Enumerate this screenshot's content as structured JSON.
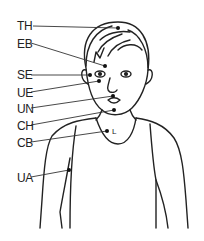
{
  "diagram": {
    "points": [
      {
        "label": "TH",
        "x": 17,
        "y": 20,
        "px": 118,
        "py": 28
      },
      {
        "label": "EB",
        "x": 17,
        "y": 38,
        "px": 105,
        "py": 66
      },
      {
        "label": "SE",
        "x": 17,
        "y": 69,
        "px": 90,
        "py": 75
      },
      {
        "label": "UE",
        "x": 17,
        "y": 87,
        "px": 99,
        "py": 81
      },
      {
        "label": "UN",
        "x": 17,
        "y": 103,
        "px": 113,
        "py": 96
      },
      {
        "label": "CH",
        "x": 17,
        "y": 120,
        "px": 114,
        "py": 110
      },
      {
        "label": "CB",
        "x": 17,
        "y": 137,
        "px": 107,
        "py": 131
      },
      {
        "label": "UA",
        "x": 17,
        "y": 172,
        "px": 69,
        "py": 170
      }
    ],
    "collarbone_mark": "L"
  }
}
